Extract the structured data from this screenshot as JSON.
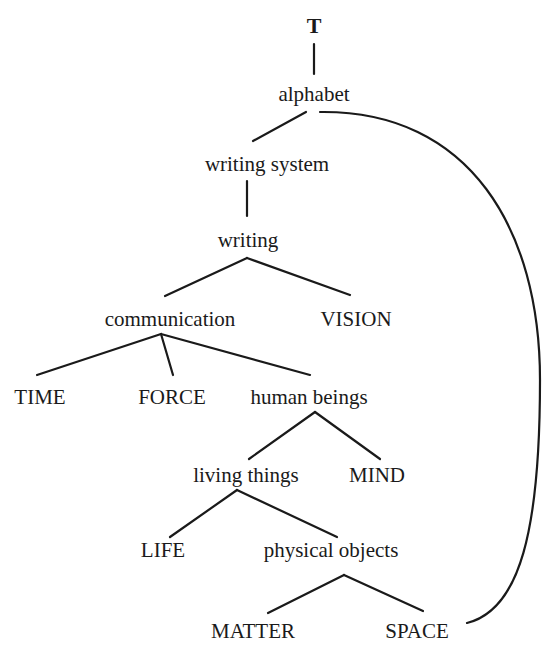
{
  "diagram": {
    "type": "tree",
    "nodes": {
      "root": {
        "label": "T",
        "x": 314,
        "y": 14
      },
      "alphabet": {
        "label": "alphabet",
        "x": 314,
        "y": 82
      },
      "writing_system": {
        "label": "writing system",
        "x": 267,
        "y": 152
      },
      "writing": {
        "label": "writing",
        "x": 248,
        "y": 228
      },
      "communication": {
        "label": "communication",
        "x": 170,
        "y": 307
      },
      "vision": {
        "label": "VISION",
        "x": 356,
        "y": 307
      },
      "time": {
        "label": "TIME",
        "x": 40,
        "y": 385
      },
      "force": {
        "label": "FORCE",
        "x": 172,
        "y": 385
      },
      "human_beings": {
        "label": "human beings",
        "x": 309,
        "y": 385
      },
      "living_things": {
        "label": "living things",
        "x": 246,
        "y": 463
      },
      "mind": {
        "label": "MIND",
        "x": 377,
        "y": 463
      },
      "life": {
        "label": "LIFE",
        "x": 163,
        "y": 538
      },
      "physical_objects": {
        "label": "physical objects",
        "x": 331,
        "y": 538
      },
      "matter": {
        "label": "MATTER",
        "x": 253,
        "y": 619
      },
      "space": {
        "label": "SPACE",
        "x": 417,
        "y": 619
      }
    },
    "edges": [
      [
        "root",
        "alphabet"
      ],
      [
        "alphabet",
        "writing_system"
      ],
      [
        "writing_system",
        "writing"
      ],
      [
        "writing",
        "communication"
      ],
      [
        "writing",
        "vision"
      ],
      [
        "communication",
        "time"
      ],
      [
        "communication",
        "force"
      ],
      [
        "communication",
        "human_beings"
      ],
      [
        "human_beings",
        "living_things"
      ],
      [
        "human_beings",
        "mind"
      ],
      [
        "living_things",
        "life"
      ],
      [
        "living_things",
        "physical_objects"
      ],
      [
        "physical_objects",
        "matter"
      ],
      [
        "physical_objects",
        "space"
      ]
    ],
    "curved_links": [
      {
        "from": "space",
        "to": "alphabet"
      }
    ]
  }
}
